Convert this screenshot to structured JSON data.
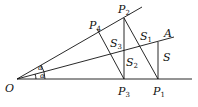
{
  "diagram": {
    "points": {
      "O": {
        "label": "O",
        "sub": ""
      },
      "P1": {
        "label": "P",
        "sub": "1"
      },
      "P2": {
        "label": "P",
        "sub": "2"
      },
      "P3": {
        "label": "P",
        "sub": "3"
      },
      "P4": {
        "label": "P",
        "sub": "4"
      },
      "A": {
        "label": "A",
        "sub": ""
      }
    },
    "areas": {
      "S": {
        "label": "S",
        "sub": ""
      },
      "S1": {
        "label": "S",
        "sub": "1"
      },
      "S2": {
        "label": "S",
        "sub": "2"
      },
      "S3": {
        "label": "S",
        "sub": "3"
      }
    },
    "angles": [
      "α",
      "α"
    ],
    "line_color": "#111111"
  }
}
